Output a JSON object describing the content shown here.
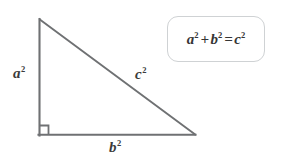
{
  "figure": {
    "background_color": "#ffffff",
    "stroke_color": "#6f7173",
    "label_color": "#3b3b3b"
  },
  "triangle": {
    "shape_name": "right-triangle",
    "vertices": {
      "apex": [
        39,
        19
      ],
      "bottom_left": [
        39,
        135
      ],
      "bottom_right": [
        195,
        135
      ]
    },
    "right_angle_marker": {
      "at_vertex": "bottom_left",
      "size_px": 9
    },
    "sides": [
      {
        "name": "vertical-leg",
        "label": "a",
        "exponent": "2",
        "label_text": "a²"
      },
      {
        "name": "hypotenuse",
        "label": "c",
        "exponent": "2",
        "label_text": "c²"
      },
      {
        "name": "horizontal-leg",
        "label": "b",
        "exponent": "2",
        "label_text": "b²"
      }
    ]
  },
  "labels": {
    "a": {
      "base": "a",
      "exponent": "2"
    },
    "b": {
      "base": "b",
      "exponent": "2"
    },
    "c": {
      "base": "c",
      "exponent": "2"
    }
  },
  "formula_box": {
    "border_color": "#cfd2d4",
    "text_color": "#353535",
    "parts": {
      "a_base": "a",
      "a_exp": "2",
      "plus": "+",
      "b_base": "b",
      "b_exp": "2",
      "equals": "=",
      "c_base": "c",
      "c_exp": "2"
    },
    "full_text": "a² + b² = c²"
  }
}
